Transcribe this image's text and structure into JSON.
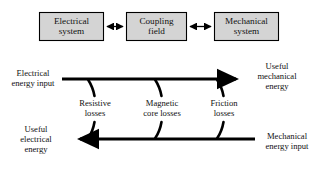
{
  "figure": {
    "background_color": "#ffffff",
    "line_color": "#000000",
    "box_fill_color": "#d4d4d4",
    "box_border_color": "#000000"
  },
  "block_diagram": {
    "boxes": [
      {
        "name": "electrical-system",
        "line1": "Electrical",
        "line2": "system"
      },
      {
        "name": "coupling-field",
        "line1": "Coupling",
        "line2": "field"
      },
      {
        "name": "mechanical-system",
        "line1": "Mechanical",
        "line2": "system"
      }
    ],
    "connectors": [
      {
        "name": "electrical-to-coupling-arrow",
        "type": "double-arrow"
      },
      {
        "name": "coupling-to-mechanical-arrow",
        "type": "double-arrow"
      }
    ]
  },
  "energy_flow": {
    "motor_flow": {
      "input_label": {
        "line1": "Electrical",
        "line2": "energy input"
      },
      "output_label": {
        "line1": "Useful",
        "line2": "mechanical",
        "line3": "energy"
      },
      "direction": "left-to-right"
    },
    "generator_flow": {
      "output_label": {
        "line1": "Useful",
        "line2": "electrical",
        "line3": "energy"
      },
      "input_label": {
        "line1": "Mechanical",
        "line2": "energy input"
      },
      "direction": "right-to-left"
    },
    "losses": [
      {
        "name": "resistive-losses",
        "line1": "Resistive",
        "line2": "losses"
      },
      {
        "name": "magnetic-core-losses",
        "line1": "Magnetic",
        "line2": "core losses"
      },
      {
        "name": "friction-losses",
        "line1": "Friction",
        "line2": "losses"
      }
    ]
  }
}
